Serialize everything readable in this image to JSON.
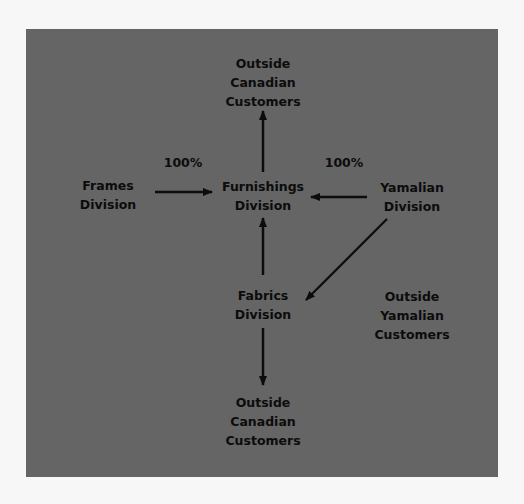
{
  "diagram": {
    "background_color": "#f7f7f7",
    "panel_color": "#656565",
    "text_color": "#0c0c0c",
    "nodes": {
      "outside_canadian_top": {
        "lines": [
          "Outside",
          "Canadian",
          "Customers"
        ]
      },
      "frames": {
        "lines": [
          "Frames",
          "Division"
        ]
      },
      "furnishings": {
        "lines": [
          "Furnishings",
          "Division"
        ]
      },
      "yamalian": {
        "lines": [
          "Yamalian",
          "Division"
        ]
      },
      "fabrics": {
        "lines": [
          "Fabrics",
          "Division"
        ]
      },
      "outside_yamalian": {
        "lines": [
          "Outside",
          "Yamalian",
          "Customers"
        ]
      },
      "outside_canadian_bottom": {
        "lines": [
          "Outside",
          "Canadian",
          "Customers"
        ]
      }
    },
    "edge_labels": {
      "frames_to_furnishings": "100%",
      "yamalian_to_furnishings": "100%"
    },
    "edges": [
      {
        "from": "Furnishings Division",
        "to": "Outside Canadian Customers (top)"
      },
      {
        "from": "Frames Division",
        "to": "Furnishings Division",
        "label": "100%"
      },
      {
        "from": "Yamalian Division",
        "to": "Furnishings Division",
        "label": "100%"
      },
      {
        "from": "Fabrics Division",
        "to": "Furnishings Division"
      },
      {
        "from": "Yamalian Division",
        "to": "Fabrics Division"
      },
      {
        "from": "Fabrics Division",
        "to": "Outside Canadian Customers (bottom)"
      }
    ]
  }
}
